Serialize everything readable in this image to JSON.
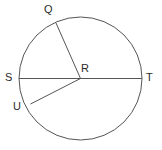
{
  "figure": {
    "name": "circle-with-radii-diagram",
    "background_color": "#ffffff",
    "stroke_color": "#555555",
    "label_color": "#2b2b2b",
    "stroke_width": 1,
    "width": 162,
    "height": 150
  },
  "circle": {
    "center_label": "R",
    "center_x": 80.5,
    "center_y": 78.5,
    "radius": 61.5
  },
  "labels": {
    "q": "Q",
    "r": "R",
    "s": "S",
    "t": "T",
    "u": "U"
  },
  "label_positions": {
    "q": {
      "x": 44,
      "y": 4
    },
    "r": {
      "x": 81,
      "y": 63
    },
    "s": {
      "x": 5,
      "y": 72
    },
    "t": {
      "x": 146,
      "y": 72
    },
    "u": {
      "x": 13,
      "y": 101
    }
  },
  "points": {
    "Q": {
      "x": 56.0,
      "y": 23.0
    },
    "R": {
      "x": 80.5,
      "y": 78.5
    },
    "S": {
      "x": 19.0,
      "y": 78.5
    },
    "T": {
      "x": 142.0,
      "y": 78.5
    },
    "U": {
      "x": 30.5,
      "y": 104.0
    }
  },
  "segments": [
    {
      "name": "diameter-S-T",
      "from": "S",
      "to": "T"
    },
    {
      "name": "radius-R-Q",
      "from": "R",
      "to": "Q"
    },
    {
      "name": "radius-R-U",
      "from": "R",
      "to": "U"
    }
  ]
}
